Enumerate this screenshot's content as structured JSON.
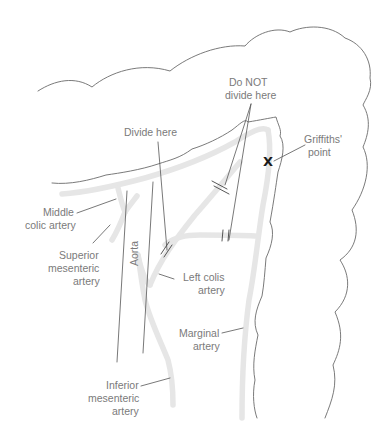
{
  "diagram": {
    "labels": {
      "do_not_divide_line1": "Do NOT",
      "do_not_divide_line2": "divide here",
      "divide_here": "Divide here",
      "griffiths_line1": "Griffiths'",
      "griffiths_line2": "point",
      "middle_colic_line1": "Middle",
      "middle_colic_line2": "colic artery",
      "sma_line1": "Superior",
      "sma_line2": "mesenteric",
      "sma_line3": "artery",
      "aorta": "Aorta",
      "left_colic_line1": "Left colis",
      "left_colic_line2": "artery",
      "marginal_line1": "Marginal",
      "marginal_line2": "artery",
      "ima_line1": "Inferior",
      "ima_line2": "mesenteric",
      "ima_line3": "artery"
    },
    "markers": {
      "griffiths_point_symbol": "X"
    },
    "colors": {
      "outline": "#6b6b6b",
      "vessel": "#e6e6e6",
      "label_text": "#7a7a7a",
      "marker": "#1a1a1a"
    }
  }
}
